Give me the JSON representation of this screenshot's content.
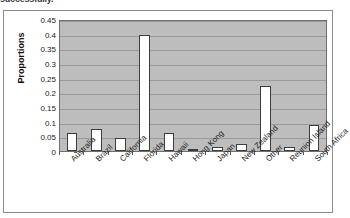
{
  "caption": {
    "clipped_text": "successfully."
  },
  "chart_data": {
    "type": "bar",
    "title": "",
    "xlabel": "",
    "ylabel": "Proportions",
    "ylim": [
      0,
      0.45
    ],
    "grid": true,
    "legend": "none",
    "plot_background": "#bdbdbd",
    "bar_fill": "#ffffff",
    "bar_border": "#3d3d3d",
    "y_ticks": [
      "0",
      "0.05",
      "0.1",
      "0.15",
      "0.2",
      "0.25",
      "0.3",
      "0.35",
      "0.4",
      "0.45"
    ],
    "y_tick_values": [
      0,
      0.05,
      0.1,
      0.15,
      0.2,
      0.25,
      0.3,
      0.35,
      0.4,
      0.45
    ],
    "categories": [
      "Australia",
      "Brazil",
      "California",
      "Florida",
      "Hawaii",
      "Hong Kong",
      "Japan",
      "New Zealand",
      "Other",
      "Reunion Island",
      "South Africa"
    ],
    "values": [
      0.06,
      0.075,
      0.046,
      0.395,
      0.06,
      0.008,
      0.012,
      0.023,
      0.22,
      0.015,
      0.087
    ]
  }
}
